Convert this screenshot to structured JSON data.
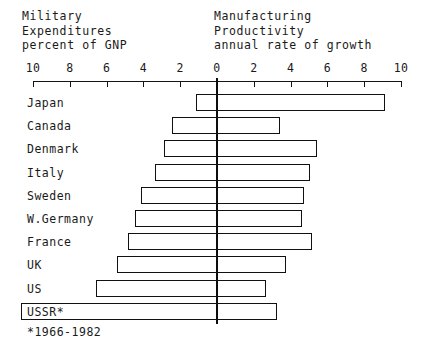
{
  "header": {
    "left_caption_lines": [
      "Military",
      "Expenditures",
      "percent of GNP"
    ],
    "right_caption_lines": [
      "Manufacturing",
      "Productivity",
      "annual rate of growth"
    ]
  },
  "footnote": "*1966-1982",
  "axis": {
    "tick_labels": [
      "10",
      "8",
      "6",
      "4",
      "2",
      "0",
      "2",
      "4",
      "6",
      "8",
      "10"
    ],
    "left_max": 10,
    "right_max": 10
  },
  "chart_data": {
    "type": "bar",
    "orientation": "horizontal-diverging",
    "subtitle": "",
    "xlabel": "",
    "ylabel": "",
    "grid": false,
    "legend": "none",
    "axis_note": "Single shared horizontal axis: values increase leftward for Military Expenditures (percent of GNP) and rightward for Manufacturing Productivity (annual rate of growth). Zero at center.",
    "xlim_left": [
      0,
      10
    ],
    "xlim_right": [
      0,
      10
    ],
    "xticks_left": [
      10,
      8,
      6,
      4,
      2,
      0
    ],
    "xticks_right": [
      0,
      2,
      4,
      6,
      8,
      10
    ],
    "categories": [
      "Japan",
      "Canada",
      "Denmark",
      "Italy",
      "Sweden",
      "W.Germany",
      "France",
      "UK",
      "US",
      "USSR*"
    ],
    "series": [
      {
        "name": "Military Expenditures percent of GNP",
        "direction": "left",
        "values": [
          1.1,
          2.4,
          2.8,
          3.3,
          4.1,
          4.4,
          4.8,
          5.4,
          6.5,
          10.6
        ]
      },
      {
        "name": "Manufacturing Productivity annual rate of growth",
        "direction": "right",
        "values": [
          9.2,
          3.5,
          5.5,
          5.1,
          4.8,
          4.7,
          5.2,
          3.8,
          2.7,
          3.3
        ]
      }
    ],
    "rows": [
      {
        "label": "Japan",
        "military": 1.1,
        "productivity": 9.2,
        "label_inside_bar": false
      },
      {
        "label": "Canada",
        "military": 2.4,
        "productivity": 3.5,
        "label_inside_bar": false
      },
      {
        "label": "Denmark",
        "military": 2.8,
        "productivity": 5.5,
        "label_inside_bar": false
      },
      {
        "label": "Italy",
        "military": 3.3,
        "productivity": 5.1,
        "label_inside_bar": false
      },
      {
        "label": "Sweden",
        "military": 4.1,
        "productivity": 4.8,
        "label_inside_bar": false
      },
      {
        "label": "W.Germany",
        "military": 4.4,
        "productivity": 4.7,
        "label_inside_bar": false
      },
      {
        "label": "France",
        "military": 4.8,
        "productivity": 5.2,
        "label_inside_bar": false
      },
      {
        "label": "UK",
        "military": 5.4,
        "productivity": 3.8,
        "label_inside_bar": false
      },
      {
        "label": "US",
        "military": 6.5,
        "productivity": 2.7,
        "label_inside_bar": false
      },
      {
        "label": "USSR*",
        "military": 10.6,
        "productivity": 3.3,
        "label_inside_bar": true
      }
    ]
  },
  "style": {
    "ink": "#111111",
    "background": "#ffffff"
  }
}
